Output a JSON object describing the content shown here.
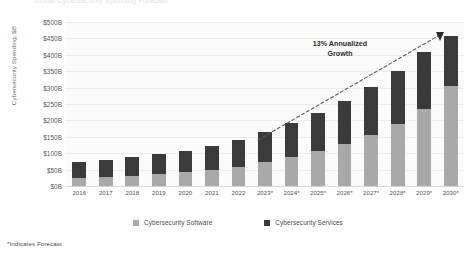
{
  "top_title": "Global Cybersecurity Spending Forecast",
  "footnote": "*Indicates Forecast",
  "annotation": {
    "line1": "13% Annualized",
    "line2": "Growth"
  },
  "legend": {
    "position": "bottom-center",
    "items": [
      {
        "label": "Cybersecurity Software",
        "color": "#a9a9a9",
        "swatch": "legend-swatch-software"
      },
      {
        "label": "Cybersecurity Services",
        "color": "#3b3b3b",
        "swatch": "legend-swatch-services"
      }
    ]
  },
  "colors": {
    "software": "#a9a9a9",
    "services": "#3b3b3b",
    "gridline": "#ededed",
    "plot_background": "#fbfbfb",
    "axis_text": "#555555"
  },
  "chart_data": {
    "type": "bar",
    "stacked": true,
    "title": "Global Cybersecurity Spending Forecast",
    "xlabel": "",
    "ylabel": "Cybersecurity Spending, $B",
    "ylim": [
      0,
      500
    ],
    "ytick_step": 50,
    "grid": true,
    "legend_position": "bottom-center",
    "annotations": [
      "13% Annualized Growth"
    ],
    "footnote": "*Indicates Forecast",
    "categories": [
      "2016",
      "2017",
      "2018",
      "2019",
      "2020",
      "2021",
      "2022",
      "2023*",
      "2024*",
      "2025*",
      "2026*",
      "2027*",
      "2028*",
      "2029*",
      "2030*"
    ],
    "ytick_labels": [
      "$500B",
      "$450B",
      "$400B",
      "$350B",
      "$300B",
      "$250B",
      "$200B",
      "$150B",
      "$100B",
      "$50B",
      "$0B"
    ],
    "ytick_values": [
      500,
      450,
      400,
      350,
      300,
      250,
      200,
      150,
      100,
      50,
      0
    ],
    "series": [
      {
        "name": "Cybersecurity Software",
        "color": "#a9a9a9",
        "values": [
          25,
          28,
          32,
          37,
          43,
          50,
          59,
          72,
          88,
          106,
          128,
          155,
          188,
          234,
          306
        ]
      },
      {
        "name": "Cybersecurity Services",
        "color": "#3b3b3b",
        "values": [
          47,
          50,
          55,
          60,
          65,
          73,
          82,
          93,
          105,
          118,
          132,
          147,
          164,
          176,
          150
        ]
      }
    ],
    "totals": [
      72,
      78,
      87,
      97,
      108,
      123,
      141,
      165,
      193,
      224,
      260,
      302,
      352,
      410,
      456
    ],
    "trend_label": "13% Annualized Growth",
    "trend_start_category": "2022",
    "trend_end_category": "2030*"
  }
}
